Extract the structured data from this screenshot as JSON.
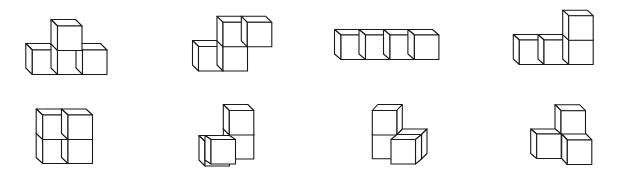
{
  "diagram": {
    "title": "",
    "stroke_color": "#1a1a1a",
    "fill_color": "#ffffff",
    "cube_size": 24.5,
    "figures": [
      {
        "id": "figure-1",
        "label": "T-shape (3 bottom, 1 top center)",
        "cubes": [
          {
            "x": 32.3,
            "y": 50,
            "dx": -6.5,
            "dy": -6.5
          },
          {
            "x": 57.5,
            "y": 50,
            "dx": -6.5,
            "dy": -6.5
          },
          {
            "x": 82.5,
            "y": 50,
            "dx": -6.5,
            "dy": -6.5
          },
          {
            "x": 57.5,
            "y": 26,
            "dx": -6.5,
            "dy": -6.5
          }
        ]
      },
      {
        "id": "figure-2",
        "label": "S-shape (2 bottom-left, 2 top-right)",
        "cubes": [
          {
            "x": 198.5,
            "y": 46.5,
            "dx": -6,
            "dy": -6
          },
          {
            "x": 223,
            "y": 46.5,
            "dx": -6,
            "dy": -6
          },
          {
            "x": 223,
            "y": 22.3,
            "dx": -6,
            "dy": -6
          },
          {
            "x": 247.3,
            "y": 22.3,
            "dx": -6,
            "dy": -6
          }
        ]
      },
      {
        "id": "figure-3",
        "label": "I-shape (4 in a row)",
        "cubes": [
          {
            "x": 341,
            "y": 35,
            "dx": -6.5,
            "dy": -5.5
          },
          {
            "x": 365.5,
            "y": 35,
            "dx": -6.5,
            "dy": -5.5
          },
          {
            "x": 390,
            "y": 35,
            "dx": -6.5,
            "dy": -5.5
          },
          {
            "x": 414.4,
            "y": 35,
            "dx": -6.5,
            "dy": -5.5
          }
        ]
      },
      {
        "id": "figure-4",
        "label": "L-shape (3 bottom, 1 top right)",
        "cubes": [
          {
            "x": 519.3,
            "y": 40,
            "dx": -6,
            "dy": -5.5
          },
          {
            "x": 544,
            "y": 40,
            "dx": -6,
            "dy": -5.5
          },
          {
            "x": 568.7,
            "y": 40,
            "dx": -6,
            "dy": -5.5
          },
          {
            "x": 568.7,
            "y": 15.7,
            "dx": -6,
            "dy": -5.5
          }
        ]
      },
      {
        "id": "figure-5",
        "label": "O-shape (2x2 square)",
        "cubes": [
          {
            "x": 42.7,
            "y": 139,
            "dx": -6.5,
            "dy": -6
          },
          {
            "x": 68,
            "y": 139,
            "dx": -6.5,
            "dy": -6
          },
          {
            "x": 42.7,
            "y": 115,
            "dx": -6.5,
            "dy": -6
          },
          {
            "x": 68,
            "y": 115,
            "dx": -6.5,
            "dy": -6
          }
        ]
      },
      {
        "id": "figure-6",
        "label": "3D corner (2-high back column, 2-deep front-left)",
        "cubes": [
          {
            "x": 229.3,
            "y": 134.5,
            "dx": -6,
            "dy": -6
          },
          {
            "x": 229.3,
            "y": 110.5,
            "dx": -6,
            "dy": -6
          },
          {
            "x": 205,
            "y": 141.5,
            "dx": -6,
            "dy": -6
          },
          {
            "x": 211,
            "y": 139.5,
            "dx": -6,
            "dy": -4
          }
        ]
      },
      {
        "id": "figure-7",
        "label": "3D corner (2-high back column, 2-deep front-right)",
        "cubes": [
          {
            "x": 372.3,
            "y": 134.3,
            "dx": 5.5,
            "dy": -6
          },
          {
            "x": 372.3,
            "y": 110.5,
            "dx": 5.5,
            "dy": -6
          },
          {
            "x": 397,
            "y": 134.5,
            "dx": 5.5,
            "dy": -5.5
          },
          {
            "x": 391,
            "y": 139.5,
            "dx": 6,
            "dy": -5
          }
        ]
      },
      {
        "id": "figure-8",
        "label": "3D tripod (top, left, front-right)",
        "cubes": [
          {
            "x": 561,
            "y": 110.7,
            "dx": -6,
            "dy": -6
          },
          {
            "x": 536.7,
            "y": 134,
            "dx": -6,
            "dy": -5
          },
          {
            "x": 567.3,
            "y": 140,
            "dx": -5.6,
            "dy": -6
          }
        ]
      }
    ]
  }
}
